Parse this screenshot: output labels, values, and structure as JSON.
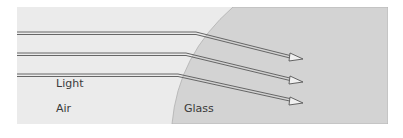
{
  "diagram": {
    "labels": {
      "light": "Light",
      "air": "Air",
      "glass": "Glass"
    },
    "colors": {
      "air_bg": "#ebebeb",
      "glass_bg": "#d2d2d2",
      "boundary": "#b8b8b8",
      "ray": "#6a6a6a"
    },
    "rays": [
      {
        "incident_y": 33,
        "enter_x": 196,
        "exit": [
          302,
          59
        ]
      },
      {
        "incident_y": 54,
        "enter_x": 186,
        "exit": [
          302,
          82
        ]
      },
      {
        "incident_y": 75,
        "enter_x": 178,
        "exit": [
          302,
          102
        ]
      }
    ]
  }
}
